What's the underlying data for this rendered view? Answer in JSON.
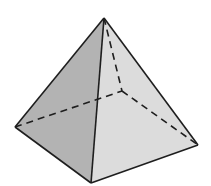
{
  "figure": {
    "vertices": {
      "apex": [
        104,
        18
      ],
      "left": [
        15,
        127
      ],
      "front": [
        91,
        183
      ],
      "right": [
        198,
        145
      ],
      "back_hidden": [
        122,
        91
      ]
    },
    "colors": {
      "background": "#ffffff",
      "left_face": "#b3b3b3",
      "right_face": "#dcdcdc",
      "edge": "#1e1e1e"
    },
    "hidden_edges_style": "dashed"
  }
}
